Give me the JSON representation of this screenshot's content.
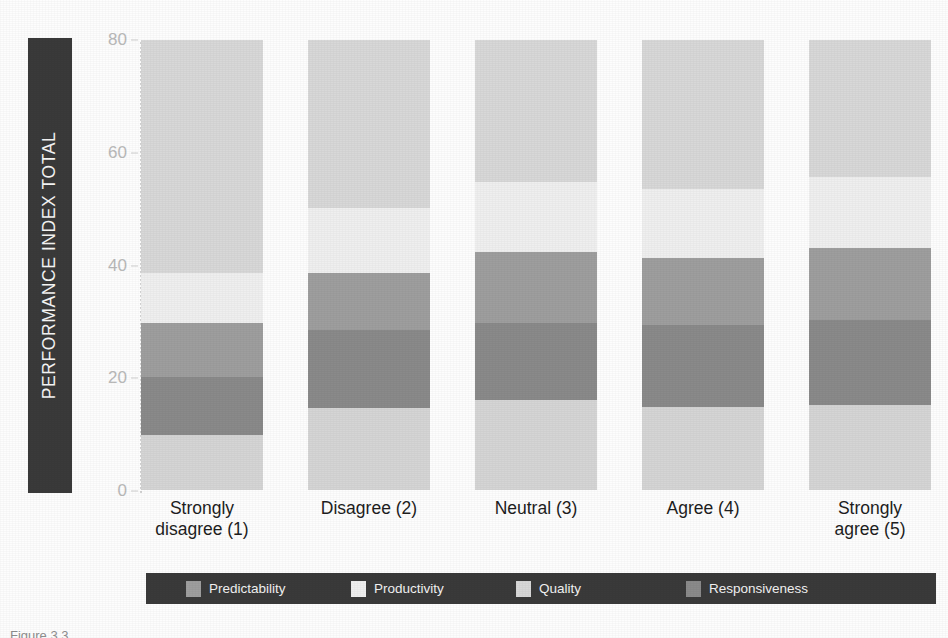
{
  "chart_data": {
    "type": "bar",
    "stacked": true,
    "title": "",
    "xlabel": "",
    "ylabel": "PERFORMANCE INDEX TOTAL",
    "ylim": [
      0,
      80
    ],
    "yticks": [
      0,
      20,
      40,
      60,
      80
    ],
    "grid": false,
    "legend_position": "bottom",
    "categories": [
      "Strongly disagree (1)",
      "Disagree (2)",
      "Neutral (3)",
      "Agree (4)",
      "Strongly agree (5)"
    ],
    "series": [
      {
        "name": "Predictability",
        "color": "#d5d5d5",
        "values": [
          9.8,
          14.6,
          16.0,
          14.8,
          15.1
        ]
      },
      {
        "name": "Productivity",
        "color": "#8a8a8a",
        "values": [
          10.3,
          13.8,
          13.7,
          14.5,
          15.1
        ]
      },
      {
        "name": "Quality",
        "color": "#9e9e9e",
        "values": [
          9.6,
          10.2,
          12.6,
          11.9,
          12.8
        ]
      },
      {
        "name": "Responsiveness",
        "color": "#efefef",
        "values": [
          8.9,
          11.5,
          12.5,
          12.3,
          12.6
        ]
      },
      {
        "name": "Responsiveness-top",
        "color": "#d8d8d8",
        "values": [
          41.4,
          29.9,
          25.2,
          26.5,
          24.4
        ]
      }
    ]
  },
  "axis": {
    "title": "PERFORMANCE INDEX TOTAL",
    "ticks": [
      "80",
      "60",
      "40",
      "20",
      "0"
    ]
  },
  "xlabels": [
    "Strongly\ndisagree (1)",
    "Disagree (2)",
    "Neutral (3)",
    "Agree (4)",
    "Strongly\nagree (5)"
  ],
  "legend": {
    "items": [
      {
        "label": "Predictability",
        "color": "#9e9e9e"
      },
      {
        "label": "Productivity",
        "color": "#efefef"
      },
      {
        "label": "Quality",
        "color": "#d8d8d8"
      },
      {
        "label": "Responsiveness",
        "color": "#8a8a8a"
      }
    ]
  },
  "caption": "Figure 3.3"
}
